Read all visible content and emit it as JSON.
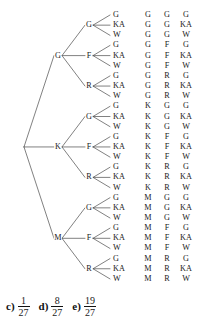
{
  "figure": {
    "type": "probability-tree-diagram",
    "levels": 3,
    "branches_per_node": 3,
    "total_outcomes": 27,
    "root": {
      "label": ""
    },
    "level1": [
      {
        "label": "G"
      },
      {
        "label": "K"
      },
      {
        "label": "M"
      }
    ],
    "level2": [
      {
        "label": "G"
      },
      {
        "label": "F"
      },
      {
        "label": "R"
      }
    ],
    "level3": [
      {
        "label": "G"
      },
      {
        "label": "KA"
      },
      {
        "label": "W"
      }
    ],
    "leaf_labels": [
      "G",
      "KA",
      "W",
      "G",
      "KA",
      "W",
      "G",
      "KA",
      "W",
      "G",
      "KA",
      "W",
      "G",
      "KA",
      "W",
      "G",
      "KA",
      "W",
      "G",
      "KA",
      "W",
      "G",
      "KA",
      "W",
      "G",
      "KA",
      "W"
    ],
    "outcomes": [
      [
        "G",
        "G",
        "G"
      ],
      [
        "G",
        "G",
        "KA"
      ],
      [
        "G",
        "G",
        "W"
      ],
      [
        "G",
        "F",
        "G"
      ],
      [
        "G",
        "F",
        "KA"
      ],
      [
        "G",
        "F",
        "W"
      ],
      [
        "G",
        "R",
        "G"
      ],
      [
        "G",
        "R",
        "KA"
      ],
      [
        "G",
        "R",
        "W"
      ],
      [
        "K",
        "G",
        "G"
      ],
      [
        "K",
        "G",
        "KA"
      ],
      [
        "K",
        "G",
        "W"
      ],
      [
        "K",
        "F",
        "G"
      ],
      [
        "K",
        "F",
        "KA"
      ],
      [
        "K",
        "F",
        "W"
      ],
      [
        "K",
        "R",
        "G"
      ],
      [
        "K",
        "R",
        "KA"
      ],
      [
        "K",
        "R",
        "W"
      ],
      [
        "M",
        "G",
        "G"
      ],
      [
        "M",
        "G",
        "KA"
      ],
      [
        "M",
        "G",
        "W"
      ],
      [
        "M",
        "F",
        "G"
      ],
      [
        "M",
        "F",
        "KA"
      ],
      [
        "M",
        "F",
        "W"
      ],
      [
        "M",
        "R",
        "G"
      ],
      [
        "M",
        "R",
        "KA"
      ],
      [
        "M",
        "R",
        "W"
      ]
    ],
    "line_color": "#4a4a4a",
    "text_color": "#1a1a1a"
  },
  "choices": [
    {
      "key": "c)",
      "numerator": "1",
      "denominator": "27"
    },
    {
      "key": "d)",
      "numerator": "8",
      "denominator": "27"
    },
    {
      "key": "e)",
      "numerator": "19",
      "denominator": "27"
    }
  ]
}
